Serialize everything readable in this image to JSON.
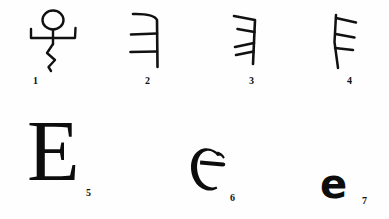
{
  "figure": {
    "background_color": "#fefefe",
    "ink_color": "#0d0d0d",
    "rows": 2,
    "total_items": 7
  },
  "items": [
    {
      "number": "1",
      "icon": "stick-figure-glyph",
      "description": "pictograph of a person with raised arms",
      "row": 1
    },
    {
      "number": "2",
      "icon": "reversed-e-curved-glyph",
      "description": "vertical stroke with curved top arm and two horizontal bars to the left",
      "row": 1
    },
    {
      "number": "3",
      "icon": "reversed-e-slanted-glyph",
      "description": "tilted vertical stroke with three angled bars to the left",
      "row": 1
    },
    {
      "number": "4",
      "icon": "e-rotated-glyph",
      "description": "vertical stroke with three angled bars to the right",
      "row": 1
    },
    {
      "number": "5",
      "icon": "capital-e-serif-glyph",
      "character": "E",
      "description": "large serif capital E",
      "row": 2
    },
    {
      "number": "6",
      "icon": "uncial-e-glyph",
      "description": "uncial e: C-shaped bowl with horizontal crossbar",
      "row": 2
    },
    {
      "number": "7",
      "icon": "lowercase-e-bold-glyph",
      "character": "e",
      "description": "bold lowercase e",
      "row": 2
    }
  ]
}
